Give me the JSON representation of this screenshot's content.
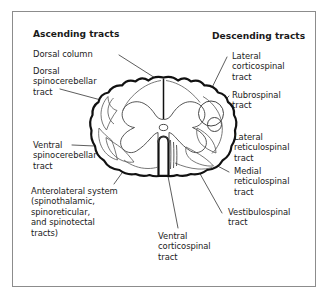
{
  "figure": {
    "background_color": "#ffffff",
    "frame_color": "#8c8c8c",
    "ink_color": "#1a1a1a",
    "leader_color": "#333333"
  },
  "headers": {
    "left": "Ascending tracts",
    "right": "Descending tracts"
  },
  "labels": {
    "dorsal_column": "Dorsal column",
    "dorsal_spinocerebellar_tract": "Dorsal\nspinocerebellar\ntract",
    "ventral_spinocerebellar_tract": "Ventral\nspinocerebellar\ntract",
    "anterolateral_system": "Anterolateral system\n(spinothalamic,\nspinoreticular,\nand spinotectal\ntracts)",
    "lateral_corticospinal_tract": "Lateral\ncorticospinal\ntract",
    "rubrospinal_tract": "Rubrospinal\ntract",
    "lateral_reticulospinal_tract": "Lateral\nreticulospinal\ntract",
    "medial_reticulospinal_tract": "Medial\nreticulospinal\ntract",
    "vestibulospinal_tract": "Vestibulospinal\ntract",
    "ventral_corticospinal_tract": "Ventral\ncorticospinal\ntract"
  }
}
